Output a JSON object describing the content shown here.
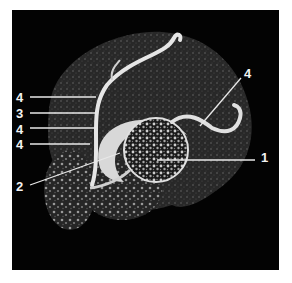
{
  "figure": {
    "background": "#030303",
    "page_background": "#ffffff",
    "label_color": "#f2f2f2",
    "labels": [
      {
        "id": "l4a",
        "text": "4",
        "x": 16,
        "y": 91
      },
      {
        "id": "l3",
        "text": "3",
        "x": 16,
        "y": 107
      },
      {
        "id": "l4b",
        "text": "4",
        "x": 16,
        "y": 123
      },
      {
        "id": "l4c",
        "text": "4",
        "x": 16,
        "y": 138
      },
      {
        "id": "l2",
        "text": "2",
        "x": 16,
        "y": 180
      },
      {
        "id": "l4d",
        "text": "4",
        "x": 244,
        "y": 67
      },
      {
        "id": "l1",
        "text": "1",
        "x": 261,
        "y": 151
      }
    ]
  }
}
